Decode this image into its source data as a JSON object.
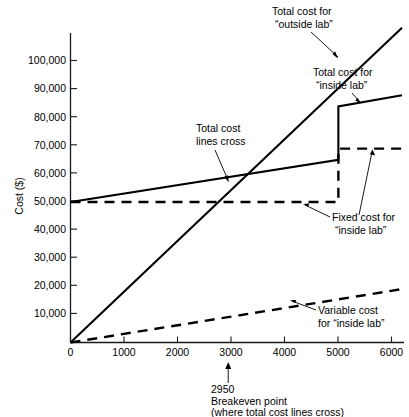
{
  "chart_data": {
    "type": "line",
    "title": "",
    "subtitle": "",
    "xlabel": "",
    "ylabel": "Cost ($)",
    "xlim": [
      0,
      6200
    ],
    "ylim": [
      0,
      107000
    ],
    "grid": false,
    "legend_position": "inline-annotations",
    "x_ticks": [
      0,
      1000,
      2000,
      3000,
      4000,
      5000,
      6000
    ],
    "x_tick_labels": [
      "0",
      "1000",
      "2000",
      "3000",
      "4000",
      "5000",
      "6000"
    ],
    "y_ticks": [
      10000,
      20000,
      30000,
      40000,
      50000,
      60000,
      70000,
      80000,
      90000,
      100000
    ],
    "y_tick_labels": [
      "10,000",
      "20,000",
      "30,000",
      "40,000",
      "50,000",
      "60,000",
      "70,000",
      "80,000",
      "90,000",
      "100,000"
    ],
    "series": [
      {
        "name": "Total cost for “outside lab”",
        "style": "solid",
        "points": [
          [
            0,
            0
          ],
          [
            6200,
            112000
          ]
        ]
      },
      {
        "name": "Total cost for “inside lab”",
        "style": "solid",
        "points": [
          [
            0,
            50000
          ],
          [
            5010,
            65000
          ],
          [
            5010,
            84000
          ],
          [
            6200,
            88000
          ]
        ]
      },
      {
        "name": "Fixed cost for “inside lab”",
        "style": "dashed",
        "points": [
          [
            0,
            50000
          ],
          [
            5010,
            50000
          ],
          [
            5010,
            69000
          ],
          [
            6200,
            69000
          ]
        ]
      },
      {
        "name": "Variable cost for “inside lab”",
        "style": "dashed",
        "points": [
          [
            0,
            0
          ],
          [
            6200,
            19000
          ]
        ]
      }
    ],
    "annotations": [
      {
        "id": "outside-lab",
        "text_lines": [
          "Total cost for",
          "“outside lab”"
        ],
        "points_to": [
          4990,
          90500
        ]
      },
      {
        "id": "inside-lab",
        "text_lines": [
          "Total cost for",
          "“inside lab”"
        ],
        "points_to": [
          5420,
          85800
        ]
      },
      {
        "id": "lines-cross",
        "text_lines": [
          "Total cost",
          "lines cross"
        ],
        "points_to": [
          2950,
          58800
        ]
      },
      {
        "id": "fixed-cost",
        "text_lines": [
          "Fixed cost for",
          "“inside lab”"
        ],
        "points_to": [
          4480,
          50000
        ]
      },
      {
        "id": "variable-cost",
        "text_lines": [
          "Variable cost",
          "for “inside lab”"
        ],
        "points_to": [
          4270,
          13200
        ]
      }
    ],
    "markers": [
      {
        "id": "breakeven",
        "x": 2950,
        "label_lines": [
          "2950",
          "Breakeven point",
          "(where total cost lines cross)"
        ]
      }
    ],
    "colors": {
      "line": "#000000",
      "axis": "#1a1a1a",
      "background": "#ffffff"
    }
  },
  "axis": {
    "y_title": "Cost ($)"
  },
  "annotation_text": {
    "outside_lab_l1": "Total cost for",
    "outside_lab_l2": "“outside lab”",
    "inside_lab_l1": "Total cost for",
    "inside_lab_l2": "“inside lab”",
    "lines_cross_l1": "Total cost",
    "lines_cross_l2": "lines cross",
    "fixed_cost_l1": "Fixed cost for",
    "fixed_cost_l2": "“inside lab”",
    "variable_cost_l1": "Variable cost",
    "variable_cost_l2": "for “inside lab”"
  },
  "caption": {
    "breakeven_value": "2950",
    "breakeven_line1": "Breakeven point",
    "breakeven_line2": "(where total cost lines cross)"
  },
  "ticks": {
    "y": {
      "t100000": "100,000",
      "t90000": "90,000",
      "t80000": "80,000",
      "t70000": "70,000",
      "t60000": "60,000",
      "t50000": "50,000",
      "t40000": "40,000",
      "t30000": "30,000",
      "t20000": "20,000",
      "t10000": "10,000"
    },
    "x": {
      "t0": "0",
      "t1000": "1000",
      "t2000": "2000",
      "t3000": "3000",
      "t4000": "4000",
      "t5000": "5000",
      "t6000": "6000"
    }
  }
}
